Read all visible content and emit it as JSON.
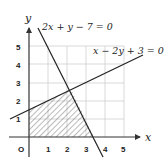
{
  "diagram": {
    "type": "linear-inequality-region",
    "axes": {
      "x_label": "x",
      "y_label": "y",
      "origin_label": "O",
      "x_ticks": [
        "1",
        "2",
        "3",
        "4",
        "5"
      ],
      "y_ticks": [
        "1",
        "2",
        "3",
        "4",
        "5"
      ]
    },
    "lines": [
      {
        "equation": "2x + y − 7 = 0",
        "color": "#222222"
      },
      {
        "equation": "x − 2y + 3 = 0",
        "color": "#222222"
      }
    ],
    "region": {
      "description": "hatched feasible region bounded by axes and both lines",
      "vertices": [
        [
          0,
          0
        ],
        [
          3.5,
          0
        ],
        [
          2.2,
          2.6
        ],
        [
          0,
          1.5
        ]
      ]
    },
    "colors": {
      "grid": "#cfcfcf",
      "axis": "#333333",
      "hatch": "#555555"
    }
  }
}
